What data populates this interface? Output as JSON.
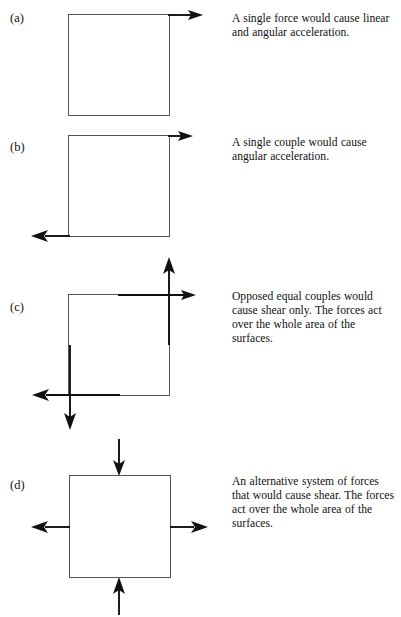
{
  "figure": {
    "title_visible": false,
    "background_color": "#ffffff",
    "ink_color": "#111111",
    "box_stroke_color": "#555555"
  },
  "panels": [
    {
      "label": "(a)",
      "caption": "A single force would cause linear and angular acceleration.",
      "diagram_name": "single-force-diagram",
      "arrows": [
        {
          "name": "force-arrow-top-right",
          "direction": "right",
          "position": "top-edge-right"
        }
      ]
    },
    {
      "label": "(b)",
      "caption": "A single couple would cause angular acceleration.",
      "diagram_name": "single-couple-diagram",
      "arrows": [
        {
          "name": "force-arrow-top-right",
          "direction": "right",
          "position": "top-edge-right"
        },
        {
          "name": "force-arrow-bottom-left",
          "direction": "left",
          "position": "bottom-edge-left"
        }
      ]
    },
    {
      "label": "(c)",
      "caption": "Opposed equal couples would cause shear only. The forces act over the whole area of the surfaces.",
      "diagram_name": "opposed-couples-diagram",
      "arrows": [
        {
          "name": "force-arrow-top-right",
          "direction": "right",
          "position": "top-edge-right"
        },
        {
          "name": "force-arrow-bottom-left",
          "direction": "left",
          "position": "bottom-edge-left"
        },
        {
          "name": "force-arrow-right-up",
          "direction": "up",
          "position": "right-edge-top"
        },
        {
          "name": "force-arrow-left-down",
          "direction": "down",
          "position": "left-edge-bottom"
        }
      ]
    },
    {
      "label": "(d)",
      "caption": "An alternative system of forces that would cause shear. The forces act over the whole area of the surfaces.",
      "diagram_name": "alternative-shear-diagram",
      "arrows": [
        {
          "name": "force-arrow-top-inward",
          "direction": "down",
          "position": "top-edge-centre"
        },
        {
          "name": "force-arrow-bottom-inward",
          "direction": "up",
          "position": "bottom-edge-centre"
        },
        {
          "name": "force-arrow-left-outward",
          "direction": "left",
          "position": "left-edge-centre"
        },
        {
          "name": "force-arrow-right-outward",
          "direction": "right",
          "position": "right-edge-centre"
        }
      ]
    }
  ]
}
